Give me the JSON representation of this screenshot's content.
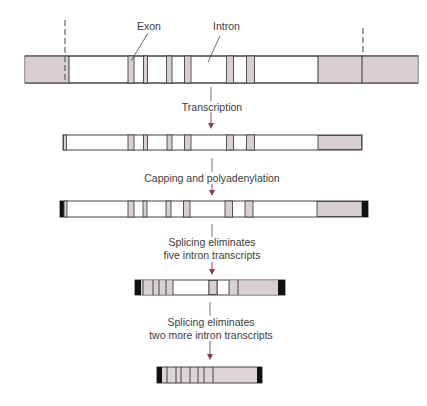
{
  "labels": {
    "exon": "Exon",
    "intron": "Intron"
  },
  "steps": [
    {
      "label_lines": [
        "Transcription"
      ]
    },
    {
      "label_lines": [
        "Capping and polyadenylation"
      ]
    },
    {
      "label_lines": [
        "Splicing eliminates",
        "five intron transcripts"
      ]
    },
    {
      "label_lines": [
        "Splicing eliminates",
        "two more intron transcripts"
      ]
    }
  ],
  "colors": {
    "exon_fill": "#d9cfd1",
    "outline": "#3a3a3a",
    "arrow": "#8a3a4e",
    "cap": "#111111"
  },
  "diagram": {
    "gene": {
      "x": 25,
      "y": 56,
      "w": 393,
      "h": 27,
      "shaded": [
        [
          25,
          69
        ],
        [
          318,
          418
        ]
      ],
      "exons": [
        [
          128,
          134
        ],
        [
          143,
          147
        ],
        [
          167,
          172
        ],
        [
          184,
          191
        ],
        [
          226,
          233
        ],
        [
          246,
          254
        ]
      ],
      "dividers": [
        69,
        318,
        362
      ],
      "dashed": [
        65,
        363
      ]
    },
    "primary_transcript": {
      "x": 63,
      "y": 135,
      "w": 299,
      "h": 15
    },
    "capped_transcript": {
      "x": 60,
      "y": 201,
      "w": 308,
      "h": 16
    },
    "partially_spliced": {
      "x": 135,
      "y": 280,
      "w": 150,
      "h": 15
    },
    "mature_mrna": {
      "x": 157,
      "y": 367,
      "w": 105,
      "h": 16
    }
  }
}
